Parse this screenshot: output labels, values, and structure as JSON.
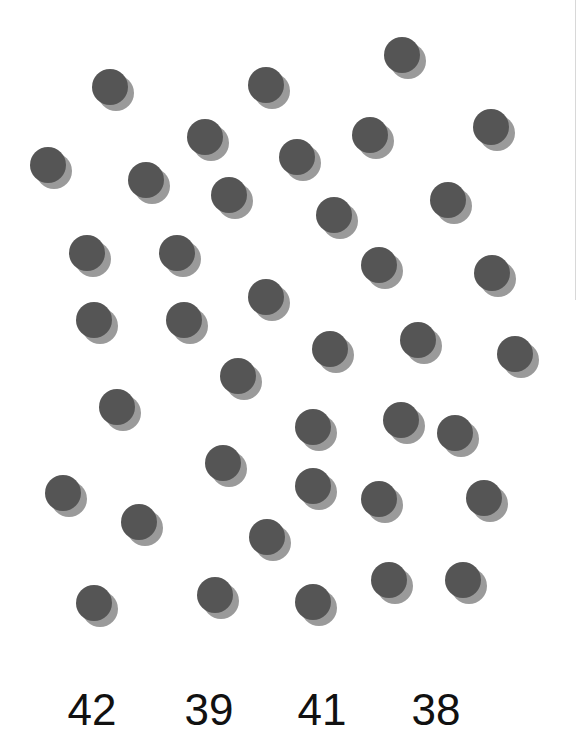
{
  "puzzle": {
    "type": "count-the-dots",
    "dot_color": "#555555",
    "shadow_color": "#9a9a9a",
    "background": "#ffffff",
    "dots": [
      {
        "x": 402,
        "y": 55
      },
      {
        "x": 110,
        "y": 87
      },
      {
        "x": 266,
        "y": 85
      },
      {
        "x": 205,
        "y": 137
      },
      {
        "x": 297,
        "y": 157
      },
      {
        "x": 370,
        "y": 135
      },
      {
        "x": 491,
        "y": 127
      },
      {
        "x": 48,
        "y": 165
      },
      {
        "x": 146,
        "y": 180
      },
      {
        "x": 229,
        "y": 195
      },
      {
        "x": 334,
        "y": 215
      },
      {
        "x": 448,
        "y": 200
      },
      {
        "x": 87,
        "y": 253
      },
      {
        "x": 177,
        "y": 253
      },
      {
        "x": 379,
        "y": 265
      },
      {
        "x": 492,
        "y": 273
      },
      {
        "x": 94,
        "y": 320
      },
      {
        "x": 184,
        "y": 320
      },
      {
        "x": 266,
        "y": 297
      },
      {
        "x": 330,
        "y": 349
      },
      {
        "x": 418,
        "y": 340
      },
      {
        "x": 515,
        "y": 354
      },
      {
        "x": 238,
        "y": 376
      },
      {
        "x": 117,
        "y": 407
      },
      {
        "x": 313,
        "y": 427
      },
      {
        "x": 401,
        "y": 420
      },
      {
        "x": 455,
        "y": 433
      },
      {
        "x": 223,
        "y": 463
      },
      {
        "x": 313,
        "y": 486
      },
      {
        "x": 63,
        "y": 493
      },
      {
        "x": 139,
        "y": 522
      },
      {
        "x": 379,
        "y": 499
      },
      {
        "x": 484,
        "y": 498
      },
      {
        "x": 267,
        "y": 537
      },
      {
        "x": 94,
        "y": 603
      },
      {
        "x": 215,
        "y": 595
      },
      {
        "x": 313,
        "y": 602
      },
      {
        "x": 389,
        "y": 580
      },
      {
        "x": 463,
        "y": 580
      }
    ]
  },
  "choices": [
    {
      "label": "42",
      "x": 92
    },
    {
      "label": "39",
      "x": 209
    },
    {
      "label": "41",
      "x": 322
    },
    {
      "label": "38",
      "x": 436
    }
  ]
}
